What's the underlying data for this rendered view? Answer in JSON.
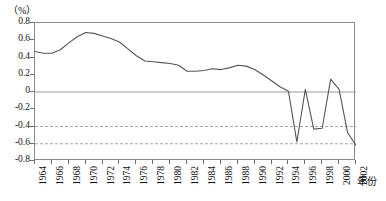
{
  "chart_data": {
    "type": "line",
    "title": "",
    "subtitle": "",
    "unit_label": "（%）",
    "xlabel": "年份",
    "ylabel": "",
    "ylim": [
      -0.8,
      0.8
    ],
    "xlim": [
      1964,
      2002
    ],
    "grid": {
      "zero_line": 0,
      "dashed_lines": [
        -0.4,
        -0.6
      ],
      "vertical_grid": false,
      "horizontal_grid": false
    },
    "legend": {
      "entries": [],
      "position": "none"
    },
    "y_ticks": [
      0.8,
      0.6,
      0.4,
      0.2,
      0,
      -0.2,
      -0.4,
      -0.6,
      -0.8
    ],
    "y_tick_labels": [
      "0.8",
      "0.6",
      "0.4",
      "0.2",
      "0",
      "-0.2",
      "-0.4",
      "-0.6",
      "-0.8"
    ],
    "x_ticks": [
      1964,
      1966,
      1968,
      1970,
      1972,
      1974,
      1976,
      1978,
      1980,
      1982,
      1984,
      1986,
      1988,
      1990,
      1992,
      1994,
      1996,
      1998,
      2000,
      2002
    ],
    "x_tick_labels": [
      "1964",
      "1966",
      "1968",
      "1970",
      "1972",
      "1974",
      "1976",
      "1978",
      "1980",
      "1982",
      "1984",
      "1986",
      "1988",
      "1990",
      "1992",
      "1994",
      "1996",
      "1998",
      "2000",
      "2002"
    ],
    "line_color": "#555555",
    "zero_line_color": "#9a9a9a",
    "dashed_line_color": "#9a9a9a",
    "frame_color": "#8a8a8a",
    "x": [
      1964,
      1965,
      1966,
      1967,
      1968,
      1969,
      1970,
      1971,
      1972,
      1973,
      1974,
      1975,
      1976,
      1977,
      1978,
      1979,
      1980,
      1981,
      1982,
      1983,
      1984,
      1985,
      1986,
      1987,
      1988,
      1989,
      1990,
      1991,
      1992,
      1993,
      1994,
      1995,
      1996,
      1997,
      1998,
      1999,
      2000,
      2001,
      2002
    ],
    "values": [
      0.47,
      0.45,
      0.45,
      0.49,
      0.57,
      0.64,
      0.69,
      0.68,
      0.65,
      0.62,
      0.58,
      0.5,
      0.42,
      0.36,
      0.35,
      0.34,
      0.33,
      0.31,
      0.24,
      0.24,
      0.25,
      0.27,
      0.26,
      0.28,
      0.31,
      0.3,
      0.26,
      0.2,
      0.13,
      0.06,
      0.01,
      -0.58,
      0.03,
      -0.43,
      -0.42,
      0.15,
      0.03,
      -0.47,
      -0.62
    ],
    "series": [
      {
        "name": "",
        "values": [
          0.47,
          0.45,
          0.45,
          0.49,
          0.57,
          0.64,
          0.69,
          0.68,
          0.65,
          0.62,
          0.58,
          0.5,
          0.42,
          0.36,
          0.35,
          0.34,
          0.33,
          0.31,
          0.24,
          0.24,
          0.25,
          0.27,
          0.26,
          0.28,
          0.31,
          0.3,
          0.26,
          0.2,
          0.13,
          0.06,
          0.01,
          -0.58,
          0.03,
          -0.43,
          -0.42,
          0.15,
          0.03,
          -0.47,
          -0.62
        ]
      }
    ],
    "annotations": []
  }
}
